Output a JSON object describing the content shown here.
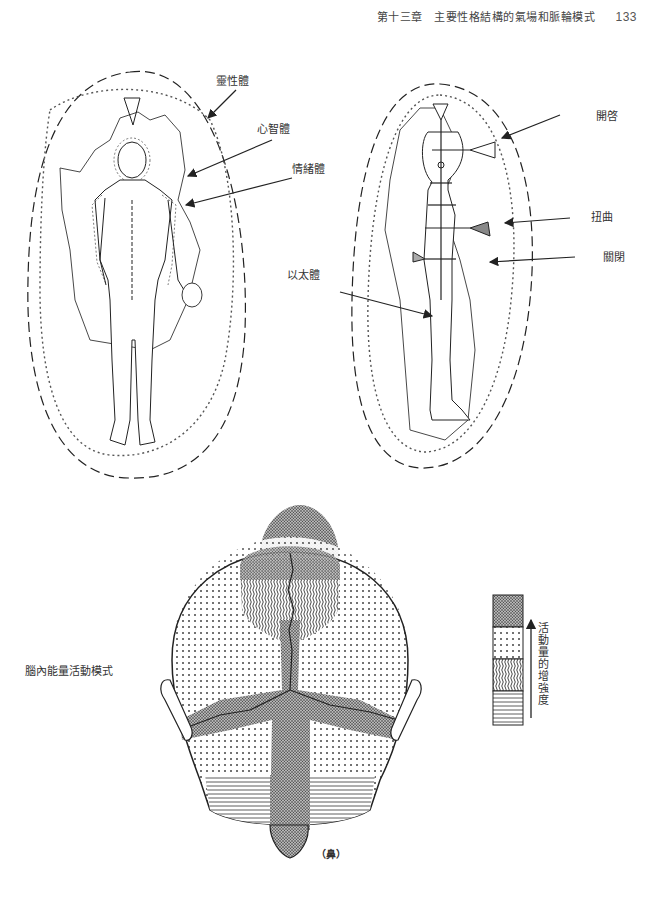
{
  "header": {
    "chapter_title": "第十三章　主要性格結構的氣場和脈輪模式",
    "page_number": "133"
  },
  "figure_front": {
    "labels": {
      "spiritual_body": "靈性體",
      "mental_body": "心智體",
      "emotional_body": "情緒體"
    }
  },
  "figure_side": {
    "labels": {
      "open": "開啓",
      "distorted": "扭曲",
      "closed": "關閉",
      "etheric_body": "以太體"
    }
  },
  "figure_brain": {
    "title": "腦內能量活動模式",
    "nose_label": "（鼻）",
    "legend": {
      "axis_label": "活動量的增強度",
      "levels": [
        {
          "pattern": "dense-stipple",
          "rank": 4
        },
        {
          "pattern": "dotted-grid",
          "rank": 3
        },
        {
          "pattern": "wavy-lines",
          "rank": 2
        },
        {
          "pattern": "horizontal-lines",
          "rank": 1
        }
      ]
    }
  }
}
